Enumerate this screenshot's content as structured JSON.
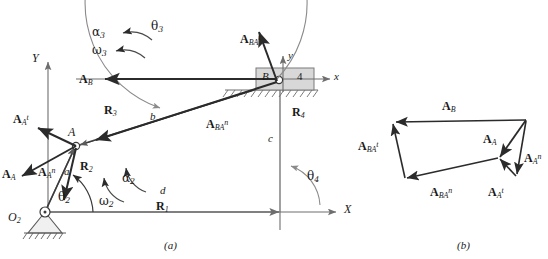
{
  "figure": {
    "caption_a": "(a)",
    "caption_b": "(b)",
    "colors": {
      "vector": "#2b2b2b",
      "link": "#5a5a5a",
      "axis": "#6e6e6e",
      "block_fill": "#d8d8d8",
      "block_stroke": "#7a7a7a",
      "arc": "#8a8a8a",
      "text": "#1a1a1a"
    }
  },
  "panel_a": {
    "axes": {
      "global_y": "Y",
      "global_x": "X",
      "local_y": "y",
      "local_x": "x"
    },
    "ground_pivot": "O",
    "ground_pivot_sub": "2",
    "joint_a": "A",
    "slider_joint": "B",
    "link_number": "4",
    "links": {
      "a": "a",
      "b": "b",
      "c": "c",
      "d": "d"
    },
    "position_vectors": [
      {
        "name": "R",
        "sub": "1"
      },
      {
        "name": "R",
        "sub": "2"
      },
      {
        "name": "R",
        "sub": "3"
      },
      {
        "name": "R",
        "sub": "4"
      }
    ],
    "angles": [
      {
        "name": "θ",
        "sub": "2"
      },
      {
        "name": "θ",
        "sub": "3"
      },
      {
        "name": "θ",
        "sub": "4"
      }
    ],
    "kinematic_terms": [
      {
        "name": "ω",
        "sub": "2"
      },
      {
        "name": "α",
        "sub": "2"
      },
      {
        "name": "ω",
        "sub": "3"
      },
      {
        "name": "α",
        "sub": "3"
      }
    ],
    "acceleration_vectors": [
      {
        "name": "A",
        "sub": "A",
        "sup": "t"
      },
      {
        "name": "A",
        "sub": "A",
        "sup": "n"
      },
      {
        "name": "A",
        "sub": "A",
        "sup": ""
      },
      {
        "name": "A",
        "sub": "B",
        "sup": ""
      },
      {
        "name": "A",
        "sub": "BA",
        "sup": "t"
      },
      {
        "name": "A",
        "sub": "BA",
        "sup": "n"
      }
    ]
  },
  "panel_b": {
    "polygon_vectors": [
      {
        "name": "A",
        "sub": "B",
        "sup": ""
      },
      {
        "name": "A",
        "sub": "BA",
        "sup": "t"
      },
      {
        "name": "A",
        "sub": "BA",
        "sup": "n"
      },
      {
        "name": "A",
        "sub": "A",
        "sup": "t"
      },
      {
        "name": "A",
        "sub": "A",
        "sup": "n"
      },
      {
        "name": "A",
        "sub": "A",
        "sup": ""
      }
    ]
  }
}
